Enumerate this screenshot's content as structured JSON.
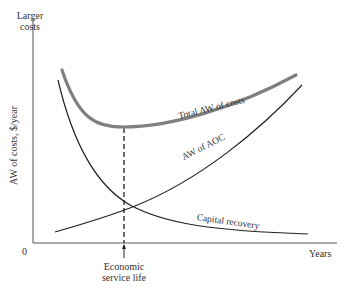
{
  "chart_data": {
    "type": "line",
    "title": "",
    "xlabel": "Years",
    "ylabel": "AW of costs, $/year",
    "y_top_label": "Larger costs",
    "origin_label": "0",
    "annotation": "Economic service life",
    "grid": false,
    "legend": "inline labels on curves",
    "x_range": [
      0,
      10
    ],
    "y_range": [
      0,
      10
    ],
    "economic_service_life_x": 3.0,
    "series": [
      {
        "name": "Total AW of costs",
        "style": "thick gray",
        "color": "#808080",
        "x": [
          0.9,
          1.5,
          2.0,
          2.5,
          3.0,
          4.0,
          5.0,
          6.0,
          7.0,
          8.0,
          8.8
        ],
        "y": [
          7.8,
          6.0,
          4.9,
          4.4,
          4.3,
          4.45,
          4.8,
          5.3,
          5.9,
          6.6,
          7.3
        ]
      },
      {
        "name": "AW of AOC",
        "style": "thin black",
        "color": "#222222",
        "x": [
          0.7,
          1.5,
          2.0,
          3.0,
          4.0,
          5.0,
          6.0,
          7.0,
          8.0,
          9.0
        ],
        "y": [
          0.6,
          1.1,
          1.4,
          1.9,
          2.6,
          3.4,
          4.2,
          5.1,
          6.0,
          7.0
        ]
      },
      {
        "name": "Capital recovery",
        "style": "thin black",
        "color": "#222222",
        "x": [
          0.8,
          1.5,
          2.0,
          2.5,
          3.0,
          4.0,
          5.0,
          6.0,
          7.0,
          8.0,
          9.0
        ],
        "y": [
          8.4,
          5.2,
          3.9,
          3.0,
          2.4,
          1.6,
          1.1,
          0.8,
          0.65,
          0.55,
          0.5
        ]
      }
    ]
  },
  "labels": {
    "y_top": "Larger costs",
    "y_axis": "AW of costs, $/year",
    "origin": "0",
    "x_axis": "Years",
    "esl_line1": "Economic",
    "esl_line2": "service life",
    "total": "Total AW of costs",
    "aoc": "AW of AOC",
    "cr": "Capital recovery"
  },
  "colors": {
    "total_curve": "#808080",
    "thin_curve": "#222222",
    "axis": "#555555",
    "text": "#333333"
  }
}
